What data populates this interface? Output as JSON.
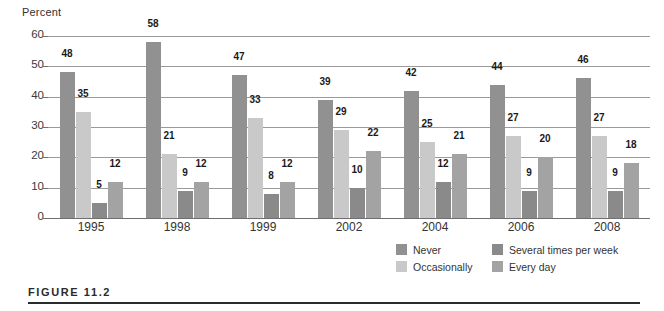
{
  "figure": {
    "caption": "FIGURE 11.2"
  },
  "chart_data": {
    "type": "bar",
    "title": "",
    "subtitle": "",
    "xlabel": "",
    "ylabel": "Percent",
    "ylim": [
      0,
      60
    ],
    "ytick_labels": [
      "60",
      "50",
      "40",
      "30",
      "20",
      "10",
      "0"
    ],
    "ytick_values": [
      60,
      50,
      40,
      30,
      20,
      10,
      0
    ],
    "grid": true,
    "legend_position": "bottom-right",
    "categories": [
      "1995",
      "1998",
      "1999",
      "2002",
      "2004",
      "2006",
      "2008"
    ],
    "series": [
      {
        "name": "Never",
        "color": "#919191",
        "values": [
          48,
          58,
          47,
          39,
          42,
          44,
          46
        ]
      },
      {
        "name": "Occasionally",
        "color": "#c9c9c9",
        "values": [
          35,
          21,
          33,
          29,
          25,
          27,
          27
        ]
      },
      {
        "name": "Several times per week",
        "color": "#8a8a8a",
        "values": [
          5,
          9,
          8,
          10,
          12,
          9,
          9
        ]
      },
      {
        "name": "Every day",
        "color": "#a3a3a3",
        "values": [
          12,
          12,
          12,
          22,
          21,
          20,
          18
        ]
      }
    ]
  }
}
